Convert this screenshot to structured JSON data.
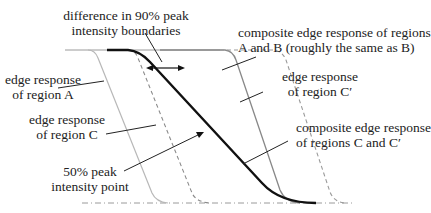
{
  "diagram": {
    "labels": {
      "difference_line1": "difference in 90% peak",
      "difference_line2": "intensity boundaries",
      "composite_ab_line1": "composite edge response of regions",
      "composite_ab_line2": "A and B (roughly the same as B)",
      "region_a_line1": "edge response",
      "region_a_line2": "of region A",
      "region_cprime_line1": "edge response",
      "region_cprime_line2": "of region C′",
      "region_c_line1": "edge response",
      "region_c_line2": "of region C",
      "composite_cc_line1": "composite edge response",
      "composite_cc_line2": "of regions C and C′",
      "peak50_line1": "50% peak",
      "peak50_line2": "intensity point"
    },
    "curves": [
      {
        "name": "edge response of region A",
        "style": "solid",
        "color": "#b0b0b0"
      },
      {
        "name": "edge response of region C",
        "style": "dashed",
        "color": "#888888"
      },
      {
        "name": "composite edge response of regions C and C′",
        "style": "solid-thick",
        "color": "#111111"
      },
      {
        "name": "composite edge response of regions A and B",
        "style": "solid",
        "color": "#888888"
      },
      {
        "name": "edge response of region C′",
        "style": "dashed",
        "color": "#999999"
      }
    ],
    "baseline": {
      "style": "dash-dot",
      "color": "#999999"
    }
  }
}
